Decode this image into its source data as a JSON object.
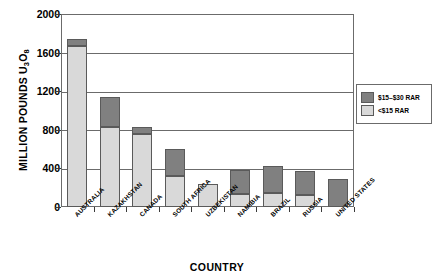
{
  "chart_data": {
    "type": "bar",
    "subtype": "stacked-vertical",
    "title": "",
    "xlabel": "COUNTRY",
    "ylabel": "MILLION POUNDS U3O8",
    "ylabel_parts": {
      "prefix": "MILLION POUNDS U",
      "sub1": "3",
      "mid": "O",
      "sub2": "8"
    },
    "categories": [
      "AUSTRALIA",
      "KAZAKHSTAN",
      "CANADA",
      "SOUTH AFRICA",
      "UZBEKISTAN",
      "NAMIBIA",
      "BRAZIL",
      "RUSSIA",
      "UNITED STATES"
    ],
    "series": [
      {
        "name": "<$15 RAR",
        "color": "#d9d9d9",
        "values": [
          1670,
          830,
          760,
          320,
          240,
          130,
          150,
          120,
          0
        ]
      },
      {
        "name": "$15–$30 RAR",
        "color": "#808080",
        "values": [
          70,
          310,
          70,
          280,
          0,
          250,
          280,
          250,
          290
        ]
      }
    ],
    "totals": [
      1740,
      1140,
      830,
      600,
      240,
      380,
      430,
      370,
      290
    ],
    "yticks": [
      0,
      400,
      800,
      1200,
      1600,
      2000
    ],
    "ylim": [
      0,
      2000
    ],
    "grid": true,
    "legend_position": "right",
    "legend_entries": [
      {
        "label": "$15–$30 RAR",
        "color": "#808080"
      },
      {
        "label": "<$15 RAR",
        "color": "#d9d9d9"
      }
    ]
  },
  "colors": {
    "dark_gray": "#808080",
    "light_gray": "#d9d9d9",
    "axis": "#6b6b6b",
    "background": "#ffffff"
  }
}
